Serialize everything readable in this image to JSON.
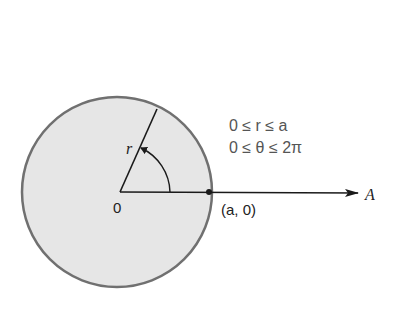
{
  "diagram": {
    "type": "polar-disk",
    "labels": {
      "origin": "0",
      "radius": "r",
      "angle": "θ",
      "point": "(a, 0)",
      "axis": "A"
    },
    "conditions": [
      "0 ≤ r ≤ a",
      "0 ≤ θ ≤ 2π"
    ],
    "colors": {
      "disk_fill": "#e6e6e6",
      "disk_stroke": "#707070",
      "lines": "#1a1a1a",
      "condition_text": "#555555"
    }
  }
}
